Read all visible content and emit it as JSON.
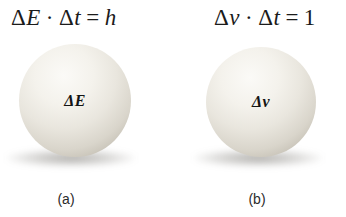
{
  "figure": {
    "colors": {
      "background": "#ffffff",
      "text": "#1b1b1b",
      "sphere_highlight": "#fbfaf7",
      "sphere_mid": "#e9e6de",
      "sphere_edge": "#a49f93",
      "shadow": "#5f5c55"
    }
  },
  "panels": [
    {
      "equation": {
        "d1": "Δ",
        "v1": "E",
        "dot": "·",
        "d2": "Δ",
        "v2": "t",
        "equals": "=",
        "rhs": "h"
      },
      "sphere_label": {
        "delta": "Δ",
        "symbol": "E"
      },
      "caption": "(a)"
    },
    {
      "equation": {
        "d1": "Δ",
        "v1": "ν",
        "dot": "·",
        "d2": "Δ",
        "v2": "t",
        "equals": "=",
        "rhs": "1"
      },
      "sphere_label": {
        "delta": "Δ",
        "symbol": "ν"
      },
      "caption": "(b)"
    }
  ]
}
